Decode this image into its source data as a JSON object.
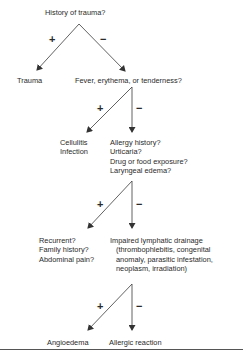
{
  "diagram": {
    "nodes": {
      "q1": "History of trauma?",
      "trauma": "Trauma",
      "q2": "Fever, erythema, or tenderness?",
      "cellulitis": [
        "Cellulitis",
        "Infection"
      ],
      "q3": [
        "Allergy history?",
        "Urticaria?",
        "Drug or food exposure?",
        "Laryngeal edema?"
      ],
      "q4": [
        "Recurrent?",
        "Family history?",
        "Abdominal pain?"
      ],
      "lymphatic": [
        "Impaired lymphatic drainage",
        "(thrombophlebitis, congenital",
        "anomaly, parasitic infestation,",
        "neoplasm, irradiation)"
      ],
      "angioedema": "Angioedema",
      "allergic": "Allergic reaction"
    },
    "signs": {
      "positive": "+",
      "negative": "−"
    },
    "edges": [
      {
        "from": "q1",
        "to": "trauma",
        "label": "+"
      },
      {
        "from": "q1",
        "to": "q2",
        "label": "−"
      },
      {
        "from": "q2",
        "to": "cellulitis",
        "label": "+"
      },
      {
        "from": "q2",
        "to": "q3",
        "label": "−"
      },
      {
        "from": "q3",
        "to": "q4",
        "label": "+"
      },
      {
        "from": "q3",
        "to": "lymphatic",
        "label": "−"
      },
      {
        "from": "q4",
        "to": "angioedema",
        "label": "+"
      },
      {
        "from": "q4",
        "to": "allergic",
        "label": "−"
      }
    ],
    "colors": {
      "line": "#3a3a3a",
      "text": "#2a2a2a"
    }
  }
}
